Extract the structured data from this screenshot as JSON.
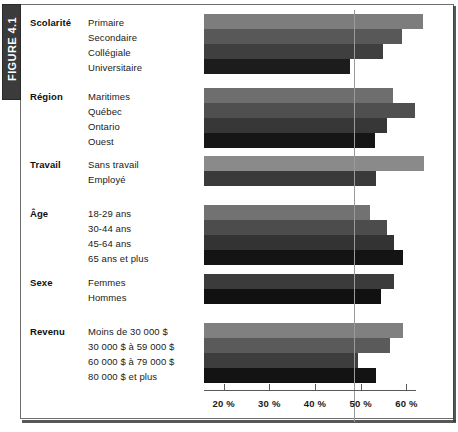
{
  "figure": {
    "tab_label": "FIGURE 4.1"
  },
  "chart_data": {
    "type": "bar",
    "orientation": "horizontal",
    "title": "",
    "xlabel": "",
    "ylabel": "",
    "xlim": [
      15.7,
      62.0
    ],
    "grid": false,
    "legend": "none",
    "reference_line": 48.5,
    "axis_ticks": [
      "20 %",
      "30 %",
      "40 %",
      "50 %",
      "60 %"
    ],
    "axis_tick_values": [
      20,
      30,
      40,
      50,
      60
    ],
    "groups": [
      {
        "name": "Scolarité",
        "categories": [
          "Primaire",
          "Secondaire",
          "Collégiale",
          "Universitaire"
        ],
        "values": [
          63.6,
          59.0,
          54.9,
          47.7
        ],
        "shades": [
          "#7d7d7d",
          "#585858",
          "#3f3f3f",
          "#1c1c1c"
        ]
      },
      {
        "name": "Région",
        "categories": [
          "Maritimes",
          "Québec",
          "Ontario",
          "Ouest"
        ],
        "values": [
          57.0,
          61.8,
          55.7,
          53.1
        ],
        "shades": [
          "#6e6e6e",
          "#4f4f4f",
          "#373737",
          "#161616"
        ]
      },
      {
        "name": "Travail",
        "categories": [
          "Sans travail",
          "Employé"
        ],
        "values": [
          63.8,
          53.3
        ],
        "shades": [
          "#8a8a8a",
          "#3a3a3a"
        ]
      },
      {
        "name": "Âge",
        "categories": [
          "18-29 ans",
          "30-44 ans",
          "45-64 ans",
          "65 ans et plus"
        ],
        "values": [
          52.0,
          55.7,
          57.2,
          59.2
        ],
        "shades": [
          "#727272",
          "#4c4c4c",
          "#333333",
          "#141414"
        ]
      },
      {
        "name": "Sexe",
        "categories": [
          "Femmes",
          "Hommes"
        ],
        "values": [
          57.2,
          54.4
        ],
        "shades": [
          "#3b3b3b",
          "#111111"
        ]
      },
      {
        "name": "Revenu",
        "categories": [
          "Moins de 30 000 $",
          "30 000 $ à 59 000 $",
          "60 000 $ à 79 000 $",
          "80 000 $ et plus"
        ],
        "values": [
          59.2,
          56.4,
          49.4,
          53.3
        ],
        "shades": [
          "#808080",
          "#5a5a5a",
          "#3d3d3d",
          "#131313"
        ]
      }
    ]
  }
}
